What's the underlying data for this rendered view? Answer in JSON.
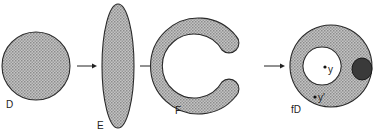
{
  "diagram": {
    "shapes": [
      {
        "id": "D",
        "label": "D",
        "description": "disk"
      },
      {
        "id": "E",
        "label": "E",
        "description": "thin vertical ellipse"
      },
      {
        "id": "F",
        "label": "F",
        "description": "C-shaped region"
      },
      {
        "id": "fD",
        "label": "fD",
        "description": "annulus with dark blob touching inner hole"
      }
    ],
    "points": [
      {
        "label": "y"
      },
      {
        "label": "y'"
      }
    ],
    "arrows": 3,
    "colors": {
      "fill": "#b8b8b8",
      "stroke": "#2a2a2a",
      "blob": "#3a3a3a",
      "background": "#ffffff"
    }
  }
}
